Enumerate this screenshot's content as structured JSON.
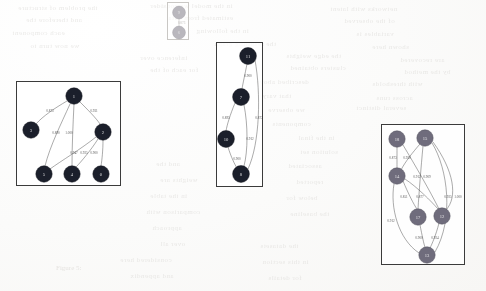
{
  "page": {
    "width": 486,
    "height": 291,
    "background_color": "#fdfdfc",
    "kind": "scanned-paper-figure"
  },
  "caption": {
    "text": "Figure 5:"
  },
  "palette": {
    "node_dark": "#1b1f2b",
    "node_mid": "#6f6c7c",
    "node_faint": "#b9b7bd",
    "edge": "#4a4a4a",
    "edge_faint": "#b5b3b0",
    "box_border": "#3b3b3b",
    "box_border_faint": "#c9c7c4",
    "bleed_text": "#d9d7d4"
  },
  "bleed_through": {
    "note": "faint mirrored text showing through from the reverse side of the scanned page",
    "lines": [
      {
        "text": "the problem of structure",
        "x": 18,
        "y": 4,
        "size": 7
      },
      {
        "text": "in the model we consider",
        "x": 150,
        "y": 2,
        "size": 7
      },
      {
        "text": "networks with latent",
        "x": 330,
        "y": 5,
        "size": 7
      },
      {
        "text": "and therefore the",
        "x": 26,
        "y": 16,
        "size": 7
      },
      {
        "text": "estimated from data",
        "x": 168,
        "y": 14,
        "size": 7
      },
      {
        "text": "of the observed",
        "x": 344,
        "y": 17,
        "size": 7
      },
      {
        "text": "each component",
        "x": 12,
        "y": 29,
        "size": 7
      },
      {
        "text": "in the following",
        "x": 196,
        "y": 27,
        "size": 7
      },
      {
        "text": "variables is",
        "x": 356,
        "y": 30,
        "size": 7
      },
      {
        "text": "we now turn to",
        "x": 30,
        "y": 42,
        "size": 7
      },
      {
        "text": "the resulting graph",
        "x": 214,
        "y": 40,
        "size": 7
      },
      {
        "text": "shown here",
        "x": 372,
        "y": 43,
        "size": 7
      },
      {
        "text": "inference over",
        "x": 140,
        "y": 54,
        "size": 7
      },
      {
        "text": "the edge weights",
        "x": 286,
        "y": 52,
        "size": 7
      },
      {
        "text": "are recovered",
        "x": 400,
        "y": 56,
        "size": 7
      },
      {
        "text": "for each of the",
        "x": 150,
        "y": 66,
        "size": 7
      },
      {
        "text": "clusters obtained",
        "x": 290,
        "y": 64,
        "size": 7
      },
      {
        "text": "by the method",
        "x": 404,
        "y": 68,
        "size": 7
      },
      {
        "text": "described above",
        "x": 256,
        "y": 78,
        "size": 7
      },
      {
        "text": "with thresholds",
        "x": 372,
        "y": 80,
        "size": 7
      },
      {
        "text": "that vary",
        "x": 262,
        "y": 92,
        "size": 7
      },
      {
        "text": "across runs",
        "x": 376,
        "y": 94,
        "size": 7
      },
      {
        "text": "we observe",
        "x": 268,
        "y": 106,
        "size": 7
      },
      {
        "text": "several distinct",
        "x": 356,
        "y": 104,
        "size": 7
      },
      {
        "text": "components",
        "x": 272,
        "y": 120,
        "size": 7
      },
      {
        "text": "in the final",
        "x": 298,
        "y": 134,
        "size": 7
      },
      {
        "text": "solution set",
        "x": 300,
        "y": 148,
        "size": 7
      },
      {
        "text": "and the",
        "x": 156,
        "y": 160,
        "size": 7
      },
      {
        "text": "associated",
        "x": 288,
        "y": 162,
        "size": 7
      },
      {
        "text": "weights are",
        "x": 160,
        "y": 176,
        "size": 7
      },
      {
        "text": "reported",
        "x": 296,
        "y": 178,
        "size": 7
      },
      {
        "text": "in the table",
        "x": 150,
        "y": 192,
        "size": 7
      },
      {
        "text": "below for",
        "x": 286,
        "y": 194,
        "size": 7
      },
      {
        "text": "comparison with",
        "x": 146,
        "y": 208,
        "size": 7
      },
      {
        "text": "the baseline",
        "x": 290,
        "y": 210,
        "size": 7
      },
      {
        "text": "approach",
        "x": 152,
        "y": 224,
        "size": 7
      },
      {
        "text": "over all",
        "x": 160,
        "y": 240,
        "size": 7
      },
      {
        "text": "the datasets",
        "x": 260,
        "y": 242,
        "size": 7
      },
      {
        "text": "considered here",
        "x": 120,
        "y": 256,
        "size": 7
      },
      {
        "text": "in this section",
        "x": 262,
        "y": 258,
        "size": 7
      },
      {
        "text": "and appendix",
        "x": 130,
        "y": 272,
        "size": 7
      },
      {
        "text": "for details",
        "x": 268,
        "y": 274,
        "size": 7
      }
    ]
  },
  "clusters": [
    {
      "id": "cluster-small-top",
      "name": "cluster-faint-pair",
      "style": "faded",
      "box": {
        "x": 167,
        "y": 2,
        "width": 22,
        "height": 38
      },
      "view": {
        "width": 22,
        "height": 38
      },
      "node_class": "faint",
      "edge_class": "faint",
      "label_class": "faint-text",
      "node_radius": 6.4,
      "nodes": [
        {
          "id": "n9",
          "label": "9",
          "cx": 11,
          "cy": 9.5
        },
        {
          "id": "n6",
          "label": "6",
          "cx": 11,
          "cy": 29.5
        }
      ],
      "edges": [
        {
          "from": "n9",
          "to": "n6",
          "weight": "0.873",
          "path": "M 11 16 C 11 20, 11 24, 11 23.2",
          "lx": 13.6,
          "ly": 20
        }
      ]
    },
    {
      "id": "cluster-left",
      "name": "cluster-six-node-tree",
      "style": "solid",
      "box": {
        "x": 16,
        "y": 81,
        "width": 105,
        "height": 105
      },
      "view": {
        "width": 105,
        "height": 105
      },
      "node_class": "dark",
      "edge_class": "",
      "label_class": "",
      "node_radius": 8.2,
      "nodes": [
        {
          "id": "n1",
          "label": "1",
          "cx": 57,
          "cy": 14
        },
        {
          "id": "n3",
          "label": "3",
          "cx": 14,
          "cy": 48
        },
        {
          "id": "n2",
          "label": "2",
          "cx": 86,
          "cy": 50
        },
        {
          "id": "n5",
          "label": "5",
          "cx": 27,
          "cy": 92
        },
        {
          "id": "n4",
          "label": "4",
          "cx": 55,
          "cy": 92
        },
        {
          "id": "n0",
          "label": "0",
          "cx": 84,
          "cy": 92
        }
      ],
      "edges": [
        {
          "from": "n1",
          "to": "n3",
          "weight": "0.873",
          "path": "M 50 19 C 38 26, 26 34, 19 42",
          "lx": 33,
          "ly": 29
        },
        {
          "from": "n1",
          "to": "n2",
          "weight": "0.931",
          "path": "M 63 20 C 71 28, 79 36, 83 42",
          "lx": 77,
          "ly": 29
        },
        {
          "from": "n1",
          "to": "n5",
          "weight": "0.890",
          "path": "M 53 22 C 44 42, 33 64, 28 84",
          "lx": 39,
          "ly": 51
        },
        {
          "from": "n1",
          "to": "n4",
          "weight": "1.000",
          "path": "M 57 22 C 56 42, 55 64, 55 84",
          "lx": 52,
          "ly": 51
        },
        {
          "from": "n2",
          "to": "n5",
          "weight": "0.947",
          "path": "M 79 55 C 64 67, 44 79, 33 87",
          "lx": 57,
          "ly": 71
        },
        {
          "from": "n2",
          "to": "n4",
          "weight": "0.925",
          "path": "M 81 57 C 74 68, 64 80, 59 85",
          "lx": 67,
          "ly": 71
        },
        {
          "from": "n2",
          "to": "n0",
          "weight": "0.900",
          "path": "M 86 58 C 86 68, 85 78, 84 84",
          "lx": 77,
          "ly": 71
        }
      ]
    },
    {
      "id": "cluster-middle",
      "name": "cluster-four-node-chain",
      "style": "solid",
      "box": {
        "x": 216,
        "y": 42,
        "width": 47,
        "height": 145
      },
      "view": {
        "width": 47,
        "height": 145
      },
      "node_class": "dark",
      "edge_class": "",
      "label_class": "",
      "node_radius": 8.4,
      "nodes": [
        {
          "id": "m11",
          "label": "11",
          "cx": 31,
          "cy": 13
        },
        {
          "id": "m7",
          "label": "7",
          "cx": 24,
          "cy": 54
        },
        {
          "id": "m10",
          "label": "10",
          "cx": 9,
          "cy": 96
        },
        {
          "id": "m8",
          "label": "8",
          "cx": 24,
          "cy": 131
        }
      ],
      "edges": [
        {
          "from": "m11",
          "to": "m7",
          "weight": "0.900",
          "path": "M 30 21 C 28 31, 26 40, 25 46",
          "lx": 31,
          "ly": 33
        },
        {
          "from": "m11",
          "to": "m8",
          "weight": "0.873",
          "path": "M 38 17 C 44 50, 43 100, 31 126",
          "lx": 42,
          "ly": 75
        },
        {
          "from": "m7",
          "to": "m10",
          "weight": "0.895",
          "path": "M 18 60 C 13 72, 10 82, 9 88",
          "lx": 9,
          "ly": 75
        },
        {
          "from": "m7",
          "to": "m8",
          "weight": "0.912",
          "path": "M 27 62 C 31 82, 31 108, 27 123",
          "lx": 33,
          "ly": 96
        },
        {
          "from": "m10",
          "to": "m8",
          "weight": "0.900",
          "path": "M 11 104 C 14 114, 18 122, 20 125",
          "lx": 20,
          "ly": 116
        }
      ]
    },
    {
      "id": "cluster-right",
      "name": "cluster-six-node-dense",
      "style": "solid",
      "box": {
        "x": 381,
        "y": 124,
        "width": 84,
        "height": 141
      },
      "view": {
        "width": 84,
        "height": 141
      },
      "node_class": "mid",
      "edge_class": "",
      "label_class": "",
      "node_radius": 8.2,
      "nodes": [
        {
          "id": "r18",
          "label": "18",
          "cx": 15,
          "cy": 14
        },
        {
          "id": "r15",
          "label": "15",
          "cx": 43,
          "cy": 13
        },
        {
          "id": "r14",
          "label": "14",
          "cx": 15,
          "cy": 51
        },
        {
          "id": "r17",
          "label": "17",
          "cx": 36,
          "cy": 92
        },
        {
          "id": "r12",
          "label": "12",
          "cx": 60,
          "cy": 91
        },
        {
          "id": "r13",
          "label": "13",
          "cx": 45,
          "cy": 130
        }
      ],
      "edges": [
        {
          "from": "r18",
          "to": "r14",
          "weight": "0.873",
          "path": "M 15 22 C 15 31, 15 39, 15 43",
          "lx": 11,
          "ly": 33
        },
        {
          "from": "r15",
          "to": "r14",
          "weight": "0.930",
          "path": "M 38 19 C 31 27, 23 37, 19 45",
          "lx": 25,
          "ly": 33
        },
        {
          "from": "r18",
          "to": "r12",
          "weight": "0.912",
          "path": "M 21 20 C 33 40, 48 66, 57 84",
          "lx": 35,
          "ly": 52
        },
        {
          "from": "r15",
          "to": "r17",
          "weight": "0.909",
          "path": "M 41 21 C 39 42, 37 68, 36 84",
          "lx": 45,
          "ly": 52
        },
        {
          "from": "r14",
          "to": "r17",
          "weight": "0.851",
          "path": "M 21 56 C 26 68, 32 80, 35 84",
          "lx": 22,
          "ly": 72
        },
        {
          "from": "r14",
          "to": "r12",
          "weight": "0.877",
          "path": "M 23 54 C 35 62, 49 76, 56 84",
          "lx": 38,
          "ly": 72
        },
        {
          "from": "r14",
          "to": "r13",
          "weight": "0.912",
          "path": "M 12 59 C 8 82, 16 114, 37 128",
          "lx": 9,
          "ly": 96
        },
        {
          "from": "r17",
          "to": "r13",
          "weight": "0.900",
          "path": "M 38 100 C 40 110, 42 120, 43 122",
          "lx": 37,
          "ly": 113
        },
        {
          "from": "r12",
          "to": "r13",
          "weight": "0.924",
          "path": "M 57 98 C 54 110, 50 119, 48 123",
          "lx": 53,
          "ly": 113
        },
        {
          "from": "r15",
          "to": "r13",
          "weight": "0.925",
          "path": "M 50 18 C 66 44, 72 94, 53 127",
          "lx": 66,
          "ly": 72
        },
        {
          "from": "r15",
          "to": "r12",
          "weight": "1.000",
          "path": "M 51 17 C 72 46, 76 72, 64 85",
          "lx": 76,
          "ly": 72
        }
      ]
    }
  ]
}
